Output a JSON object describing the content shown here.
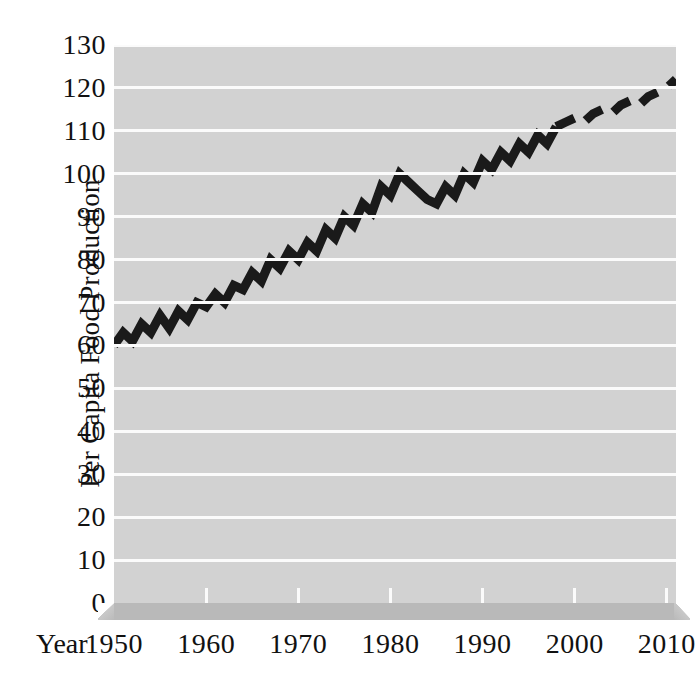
{
  "chart_data": {
    "type": "line",
    "title": "",
    "xlabel": "Year",
    "ylabel": "Per Capita Food Production",
    "xlim": [
      1950,
      2011
    ],
    "ylim": [
      0,
      130
    ],
    "grid": true,
    "legend": "none",
    "y_ticks": [
      130,
      120,
      110,
      100,
      90,
      80,
      70,
      60,
      50,
      40,
      30,
      20,
      10,
      0
    ],
    "x_ticks": [
      1950,
      1960,
      1970,
      1980,
      1990,
      2000,
      2010
    ],
    "series": [
      {
        "name": "Per Capita Food Production (observed)",
        "style": "solid",
        "color": "#1a1a1a",
        "x": [
          1950,
          1951,
          1952,
          1953,
          1954,
          1955,
          1956,
          1957,
          1958,
          1959,
          1960,
          1961,
          1962,
          1963,
          1964,
          1965,
          1966,
          1967,
          1968,
          1969,
          1970,
          1971,
          1972,
          1973,
          1974,
          1975,
          1976,
          1977,
          1978,
          1979,
          1980,
          1981,
          1982,
          1983,
          1984,
          1985,
          1986,
          1987,
          1988,
          1989,
          1990,
          1991,
          1992,
          1993,
          1994,
          1995,
          1996,
          1997,
          1998
        ],
        "y": [
          60,
          63,
          61,
          65,
          63,
          67,
          64,
          68,
          66,
          70,
          69,
          72,
          70,
          74,
          73,
          77,
          75,
          80,
          78,
          82,
          80,
          84,
          82,
          87,
          85,
          90,
          88,
          93,
          91,
          97,
          95,
          100,
          98,
          96,
          94,
          93,
          97,
          95,
          100,
          98,
          103,
          101,
          105,
          103,
          107,
          105,
          109,
          107,
          111
        ],
        "annual_pattern": "saw-tooth: each year alternates up-down around a rising trend"
      },
      {
        "name": "Per Capita Food Production (projected)",
        "style": "dashed",
        "color": "#1a1a1a",
        "x": [
          1998,
          1999,
          2000,
          2001,
          2002,
          2003,
          2004,
          2005,
          2006,
          2007,
          2008,
          2009,
          2010,
          2011
        ],
        "y": [
          111,
          112,
          113,
          112,
          114,
          115,
          114,
          116,
          117,
          116,
          118,
          119,
          120,
          122
        ]
      }
    ]
  },
  "axes": {
    "y_title": "Per Capita Food Production",
    "x_title": "Year",
    "y_tick_labels": [
      "130",
      "120",
      "110",
      "100",
      "90",
      "80",
      "70",
      "60",
      "50",
      "40",
      "30",
      "20",
      "10",
      "0"
    ],
    "x_tick_labels": [
      "1950",
      "1960",
      "1970",
      "1980",
      "1990",
      "2000",
      "2010"
    ]
  },
  "style": {
    "plot_background": "#d2d2d2",
    "gridline_color": "#fbfbfb",
    "line_color": "#1a1a1a",
    "baseplate_color": "#b9b9b9",
    "page_background": "#ffffff",
    "text_color": "#111111"
  }
}
